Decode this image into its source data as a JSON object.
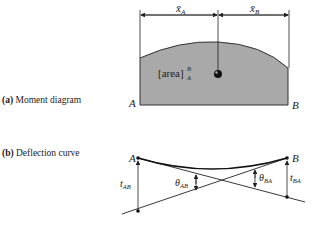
{
  "figure": {
    "panel_a": {
      "caption": "(a) Moment diagram",
      "caption_prefix": "(a)",
      "caption_text": "Moment diagram",
      "area_label": "[area]",
      "area_sup": "B",
      "area_sub": "A",
      "left_point": "A",
      "right_point": "B",
      "xbar_a": "x̄",
      "xbar_a_sub": "A",
      "xbar_b": "x̄",
      "xbar_b_sub": "B",
      "fill_color": "#a9a9a9"
    },
    "panel_b": {
      "caption": "(b) Deflection curve",
      "caption_prefix": "(b)",
      "caption_text": "Deflection curve",
      "left_point": "A",
      "right_point": "B",
      "t_ab": "t",
      "t_ab_sub": "AB",
      "t_ba": "t",
      "t_ba_sub": "BA",
      "theta_ab": "θ",
      "theta_ab_sub": "AB",
      "theta_ba": "θ",
      "theta_ba_sub": "BA"
    }
  }
}
